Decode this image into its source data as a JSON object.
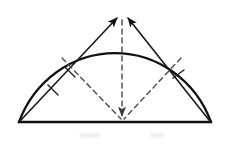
{
  "figure": {
    "type": "geometry-diagram",
    "canvas": {
      "width": 228,
      "height": 144,
      "background": "#ffffff"
    },
    "stroke": {
      "arc_color": "#111111",
      "baseline_color": "#111111",
      "chord_color": "#1a1a1a",
      "dashed_color": "#555555",
      "arc_width": 2.2,
      "baseline_width": 2.4,
      "chord_width": 1.5,
      "dashed_width": 1.4,
      "tick_width": 1.3,
      "dash_pattern": "5,4"
    },
    "geometry": {
      "baseline_left": {
        "x": 19,
        "y": 122
      },
      "baseline_right": {
        "x": 211,
        "y": 122
      },
      "arc_apex": {
        "x": 122,
        "y": 14
      },
      "arc_center": {
        "x": 115,
        "y": 122
      },
      "arc_radius_x": 96,
      "arc_radius_y": 108,
      "dashed_origin": {
        "x": 122,
        "y": 121
      },
      "dashed_left_end": {
        "x": 62,
        "y": 58
      },
      "dashed_top_end": {
        "x": 122,
        "y": 20
      },
      "dashed_right_end": {
        "x": 180,
        "y": 58
      }
    },
    "arrows": {
      "left_chord": {
        "from": {
          "x": 21,
          "y": 120
        },
        "to": {
          "x": 118,
          "y": 17
        },
        "arrowhead": "at-apex",
        "tick_count": 2
      },
      "right_chord": {
        "from": {
          "x": 209,
          "y": 120
        },
        "to": {
          "x": 127,
          "y": 17
        },
        "arrowhead": "at-apex",
        "tick_count": 1
      },
      "center_dashed": {
        "from": {
          "x": 122,
          "y": 20
        },
        "to": {
          "x": 122,
          "y": 121
        },
        "arrowhead": "at-baseline",
        "tick_count": 0
      }
    },
    "ticks": {
      "left_chord": [
        {
          "x": 43,
          "y": 97,
          "t": 0.22
        },
        {
          "x": 60,
          "y": 79,
          "t": 0.38
        }
      ],
      "right_chord": [
        {
          "x": 179,
          "y": 83,
          "t": 0.37
        }
      ]
    },
    "smudges": [
      {
        "x": 80,
        "y": 133,
        "w": 20,
        "h": 5
      },
      {
        "x": 150,
        "y": 133,
        "w": 14,
        "h": 5
      }
    ]
  }
}
